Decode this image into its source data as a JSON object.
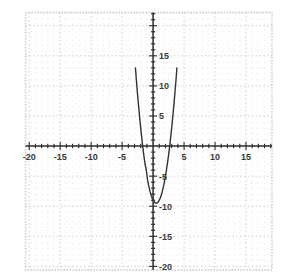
{
  "chart_data": {
    "type": "line",
    "title": "",
    "subtitle": "",
    "xlabel": "",
    "ylabel": "",
    "xlim": [
      -20.6,
      19.2
    ],
    "ylim": [
      -20.6,
      22.2
    ],
    "grid": true,
    "grid_minor_step": 1,
    "grid_major_step": 5,
    "legend": "none",
    "axis_origin": [
      0,
      0
    ],
    "xticks": [
      -20,
      -15,
      -10,
      -5,
      5,
      10,
      15
    ],
    "yticks": [
      15,
      10,
      5,
      -5,
      -10,
      -15,
      -20
    ],
    "xtick_labels": [
      "-20",
      "-15",
      "-10",
      "-5",
      "5",
      "10",
      "15"
    ],
    "ytick_labels": [
      "15",
      "10",
      "5",
      "-5",
      "-10",
      "-15",
      "-20"
    ],
    "tick_minor_step": 1,
    "series": [
      {
        "name": "parabola",
        "equation": "y = 2(x - 0.5)^2 - 9.5",
        "color": "#333333",
        "vertex": [
          0.5,
          -9.5
        ],
        "roots": [
          -1.68,
          2.68
        ],
        "x": [
          -2.85,
          -2.7,
          -2.5,
          -2.3,
          -2.1,
          -1.9,
          -1.68,
          -1.5,
          -1.3,
          -1.1,
          -0.9,
          -0.7,
          -0.5,
          -0.3,
          -0.1,
          0.1,
          0.3,
          0.5,
          0.7,
          0.9,
          1.1,
          1.3,
          1.5,
          1.7,
          1.9,
          2.1,
          2.3,
          2.5,
          2.68,
          2.9,
          3.1,
          3.3,
          3.5,
          3.7,
          3.85
        ],
        "y": [
          13.0,
          10.98,
          8.5,
          6.18,
          4.02,
          2.02,
          0.0,
          -1.5,
          -2.98,
          -3.98,
          -5.58,
          -6.62,
          -7.5,
          -8.22,
          -8.78,
          -9.18,
          -9.42,
          -9.5,
          -9.42,
          -9.18,
          -8.78,
          -8.22,
          -7.5,
          -6.62,
          -5.58,
          -4.38,
          -3.02,
          -1.5,
          0.0,
          2.02,
          4.02,
          6.18,
          8.5,
          10.98,
          13.0
        ]
      }
    ]
  },
  "frame": {
    "left": -20.6,
    "right": 19.2,
    "top": 22.2,
    "bottom": -20.6,
    "border_color": "#c9c9c9"
  },
  "colors": {
    "axis": "#2b2b2b",
    "grid_minor": "#dedede",
    "grid_major": "#cfcfcf",
    "curve": "#333333",
    "label": "#3a3a3a",
    "background": "#ffffff"
  }
}
